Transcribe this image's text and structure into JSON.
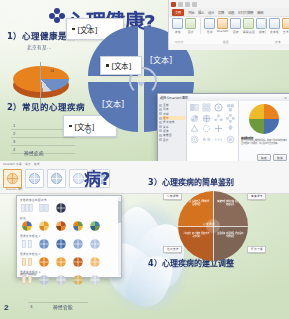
{
  "document": {
    "kind": "powerpoint-screenshot-collage",
    "panel_count": 2
  },
  "top_panel": {
    "slide": {
      "title": "心理健康?",
      "outline": [
        {
          "number": "1）",
          "text": "心理健康是病"
        },
        {
          "number": "2）",
          "text": "常见的心理疾病"
        }
      ],
      "subcaption": "北京有某…",
      "placeholders": [
        "[文本]",
        "[文本]",
        "[文本]",
        "[文本]",
        "[文本]",
        "[文本]"
      ],
      "table_rows": [
        "1",
        "2",
        "3",
        "4"
      ],
      "table_footer": "神经症病",
      "pie_label": "14"
    },
    "ribbon": {
      "quick_access": [
        "save-icon",
        "undo-icon",
        "redo-icon",
        "customize-icon"
      ],
      "tabs": [
        {
          "label": "文件",
          "active": true
        },
        {
          "label": "开始",
          "active": false
        },
        {
          "label": "插入",
          "active": false
        },
        {
          "label": "设计",
          "active": false
        },
        {
          "label": "切换",
          "active": false
        },
        {
          "label": "动画",
          "active": false
        },
        {
          "label": "幻灯片放映",
          "active": false
        },
        {
          "label": "审阅",
          "active": false
        }
      ],
      "groups": [
        {
          "label": "幻灯片",
          "buttons": [
            {
              "label": "表格",
              "icon": "table-icon"
            },
            {
              "label": "图片",
              "icon": "picture-icon"
            }
          ]
        },
        {
          "label": "插图",
          "buttons": [
            {
              "label": "形状",
              "icon": "shapes-icon"
            },
            {
              "label": "SmartArt",
              "icon": "smartart-icon"
            },
            {
              "label": "图表",
              "icon": "chart-icon"
            },
            {
              "label": "屏幕截图",
              "icon": "screenshot-icon"
            },
            {
              "label": "相册",
              "icon": "album-icon"
            }
          ]
        },
        {
          "label": "文本",
          "buttons": [
            {
              "label": "文本框",
              "icon": "textbox-icon"
            },
            {
              "label": "艺术字",
              "icon": "wordart-icon"
            },
            {
              "label": "页眉",
              "icon": "header-icon"
            }
          ]
        }
      ]
    },
    "dialog": {
      "title": "选择 SmartArt 图形",
      "close_label": "✕",
      "categories": [
        {
          "label": "全部",
          "selected": false
        },
        {
          "label": "列表",
          "selected": false
        },
        {
          "label": "流程",
          "selected": false
        },
        {
          "label": "循环",
          "selected": true
        },
        {
          "label": "层次结构",
          "selected": false
        },
        {
          "label": "关系",
          "selected": false
        },
        {
          "label": "矩阵",
          "selected": false
        },
        {
          "label": "棱锥图",
          "selected": false
        },
        {
          "label": "图片",
          "selected": false
        }
      ],
      "preview_title": "基本循环矩阵",
      "preview_desc": "用于显示与中心概念的关系。前四个形状中的文本会显示在四个象限中，中心形状不显示文本。",
      "buttons": [
        {
          "label": "确定"
        },
        {
          "label": "取消"
        }
      ]
    }
  },
  "bottom_panel": {
    "slide": {
      "title_fragment": "病?",
      "outline": [
        {
          "number": "3）",
          "text": "心理疾病的简单鉴别"
        },
        {
          "number": "4）",
          "text": "心理疾病的建立调整"
        }
      ],
      "left_number": "2",
      "table_rows": [
        "4"
      ],
      "table_footer": "神经官能"
    },
    "design_tab": {
      "tabs": [
        "SmartArt 工具",
        "设计",
        "格式"
      ],
      "styles_caption": "SmartArt 样式",
      "style_items": [
        {
          "name": "简单填充",
          "selected": true
        },
        {
          "name": "白色轮廓",
          "selected": false
        },
        {
          "name": "细微效果",
          "selected": false
        },
        {
          "name": "强烈效果",
          "selected": false
        },
        {
          "name": "优雅",
          "selected": false
        }
      ]
    },
    "gallery": {
      "sections": [
        {
          "label": "文档的最佳匹配对象",
          "swatches": [
            "doc-1",
            "doc-2",
            "doc-3"
          ]
        },
        {
          "label": "彩色",
          "swatches": [
            "c1",
            "c2",
            "c3",
            "c4",
            "c5"
          ]
        },
        {
          "label": "强调文字颜色 1",
          "swatches": [
            "a1",
            "a2",
            "a3",
            "a4",
            "a5"
          ]
        },
        {
          "label": "强调文字颜色 2",
          "swatches": [
            "b1",
            "b2",
            "b3",
            "b4",
            "b5"
          ]
        },
        {
          "label": "强调文字颜色 3",
          "swatches": [
            "d1",
            "d2",
            "d3",
            "d4",
            "d5"
          ]
        }
      ],
      "footer": "其他主题填充颜色"
    },
    "diagram": {
      "center_label": "心理调适",
      "quadrants": [
        {
          "pos": "top-left",
          "text": "自我认识 接纳自己 调整期望 合理归因"
        },
        {
          "pos": "top-right",
          "text": "情绪管理 放松训练 倾诉宣泄 转移注意"
        },
        {
          "pos": "bottom-left",
          "text": "人际支持 家人陪伴 朋友交流 寻求帮助"
        },
        {
          "pos": "bottom-right",
          "text": "生活规律 充足睡眠 适度运动 均衡饮食"
        }
      ],
      "callouts": [
        {
          "pos": "top-left",
          "text": "认知调整"
        },
        {
          "pos": "top-right",
          "text": "情绪调节"
        },
        {
          "pos": "bottom-left",
          "text": "社会支持"
        },
        {
          "pos": "bottom-right",
          "text": "行为习惯"
        }
      ]
    }
  },
  "colors": {
    "slide_green_light": "#f3f7ee",
    "slide_green_dark": "#cfe0c0",
    "title_blue": "#2e3f8f",
    "smartart_blue": "#5a78b4",
    "accent_orange": "#d4731f",
    "accent_brown": "#8a6a58",
    "ribbon_red": "#c4461f"
  }
}
